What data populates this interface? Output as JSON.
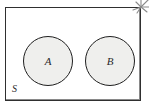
{
  "diagram": {
    "universal_set": {
      "label": "S",
      "shape": "rectangle",
      "border_color": "#2f2f2f",
      "fill_color": "#ffffff"
    },
    "sets": [
      {
        "label": "A",
        "shape": "circle",
        "fill_color": "#efefed",
        "border_color": "#1f1f1f"
      },
      {
        "label": "B",
        "shape": "circle",
        "fill_color": "#efefed",
        "border_color": "#1f1f1f"
      }
    ],
    "annotations": [
      {
        "name": "sparkle-mark",
        "position": "top-right-corner",
        "color": "#8a8a8a"
      }
    ]
  }
}
